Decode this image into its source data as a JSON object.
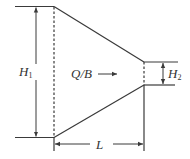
{
  "diagram": {
    "title": "",
    "colors": {
      "line": "#3a3a3a",
      "background": "#ffffff"
    },
    "labels": {
      "h1_main": "H",
      "h1_sub": "1",
      "h2_main": "H",
      "h2_sub": "2",
      "flow": "Q/B",
      "length": "L"
    },
    "icons": {
      "flow_arrow": "right-arrow-icon",
      "dimension_arrows": "double-headed-arrow"
    },
    "geometry": {
      "upstream_top_y": 6,
      "upstream_bottom_y": 137,
      "downstream_top_y": 62,
      "downstream_bottom_y": 85,
      "transition_start_x": 54,
      "transition_end_x": 144
    }
  }
}
